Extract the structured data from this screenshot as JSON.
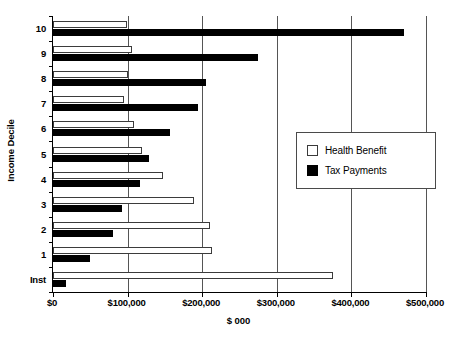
{
  "chart_data": {
    "type": "bar",
    "orientation": "horizontal",
    "title": "",
    "xlabel": "$ 000",
    "ylabel": "Income Decile",
    "xlim": [
      0,
      500000
    ],
    "xticks": [
      0,
      100000,
      200000,
      300000,
      400000,
      500000
    ],
    "xtick_labels": [
      "$0",
      "$100,000",
      "$200,000",
      "$300,000",
      "$400,000",
      "$500,000"
    ],
    "grid": "vertical",
    "legend_position": "center-right",
    "categories": [
      "10",
      "9",
      "8",
      "7",
      "6",
      "5",
      "4",
      "3",
      "2",
      "1",
      "Inst"
    ],
    "series": [
      {
        "name": "Health Benefit",
        "color": "#ffffff",
        "edge_color": "#3b3b3b",
        "values": [
          99000,
          106000,
          100000,
          95000,
          108000,
          119000,
          147000,
          189000,
          210000,
          213000,
          375000
        ]
      },
      {
        "name": "Tax Payments",
        "color": "#000000",
        "edge_color": "#000000",
        "values": [
          470000,
          275000,
          205000,
          195000,
          157000,
          129000,
          117000,
          92000,
          80000,
          50000,
          18000
        ]
      }
    ]
  },
  "legend": {
    "items": [
      {
        "label": "Health Benefit",
        "swatch": "open-square-swatch"
      },
      {
        "label": "Tax Payments",
        "swatch": "filled-square-swatch"
      }
    ]
  },
  "axes": {
    "y_title": "Income Decile",
    "x_title": "$ 000"
  }
}
